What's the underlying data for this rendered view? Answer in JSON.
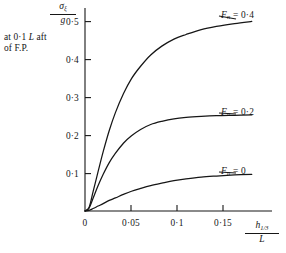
{
  "figure": {
    "background_color": "#ffffff",
    "ink_color": "#161616",
    "annotation_lines": [
      "at 0·1 L aft",
      "of F.P."
    ],
    "annotation_italic_token": "L"
  },
  "chart_data": {
    "type": "line",
    "title": "",
    "subtitle": "",
    "annotation": "at 0·1 L aft of F.P.",
    "xlabel": "h_{1/3} / L",
    "xlabel_numerator": "h",
    "xlabel_numerator_sub": "1/3",
    "xlabel_denominator": "L",
    "ylabel": "σ_ξ / g",
    "ylabel_numerator": "σ",
    "ylabel_numerator_sub": "ξ",
    "ylabel_denominator": "g",
    "xlim": [
      0,
      0.185
    ],
    "ylim": [
      0,
      0.575
    ],
    "grid": false,
    "legend_position": "inline-right-of-curves",
    "xticks": [
      0,
      0.05,
      0.1,
      0.15
    ],
    "xtick_labels": [
      "0",
      "0·05",
      "0·1",
      "0·15"
    ],
    "yticks": [
      0.1,
      0.2,
      0.3,
      0.4,
      0.5
    ],
    "ytick_labels": [
      "0·1",
      "0·2",
      "0·3",
      "0·4",
      "0·5"
    ],
    "series": [
      {
        "name": "F_n = 0·4",
        "label_prefix": "F",
        "label_sub": "n",
        "label_value": "0·4",
        "saturation_value": 0.545,
        "x": [
          0.004,
          0.008,
          0.013,
          0.018,
          0.024,
          0.03,
          0.038,
          0.046,
          0.055,
          0.065,
          0.076,
          0.088,
          0.1,
          0.115,
          0.13,
          0.148,
          0.165
        ],
        "y": [
          0.01,
          0.055,
          0.112,
          0.168,
          0.228,
          0.278,
          0.332,
          0.375,
          0.41,
          0.442,
          0.467,
          0.487,
          0.5,
          0.514,
          0.523,
          0.531,
          0.537
        ]
      },
      {
        "name": "F_n = 0·2",
        "label_prefix": "F",
        "label_sub": "n",
        "label_value": "0·2",
        "saturation_value": 0.272,
        "x": [
          0.004,
          0.008,
          0.013,
          0.018,
          0.024,
          0.03,
          0.038,
          0.046,
          0.055,
          0.065,
          0.076,
          0.088,
          0.1,
          0.115,
          0.13,
          0.148,
          0.165
        ],
        "y": [
          0.008,
          0.036,
          0.072,
          0.104,
          0.137,
          0.163,
          0.192,
          0.213,
          0.231,
          0.245,
          0.254,
          0.261,
          0.265,
          0.268,
          0.27,
          0.271,
          0.272
        ]
      },
      {
        "name": "F_n = 0",
        "label_prefix": "F",
        "label_sub": "n",
        "label_value": "0",
        "saturation_value": 0.104,
        "x": [
          0.004,
          0.008,
          0.013,
          0.018,
          0.024,
          0.03,
          0.038,
          0.046,
          0.055,
          0.065,
          0.076,
          0.088,
          0.1,
          0.115,
          0.13,
          0.148,
          0.165
        ],
        "y": [
          0.002,
          0.007,
          0.014,
          0.021,
          0.03,
          0.037,
          0.047,
          0.056,
          0.064,
          0.072,
          0.079,
          0.086,
          0.091,
          0.096,
          0.099,
          0.102,
          0.104
        ]
      }
    ]
  }
}
